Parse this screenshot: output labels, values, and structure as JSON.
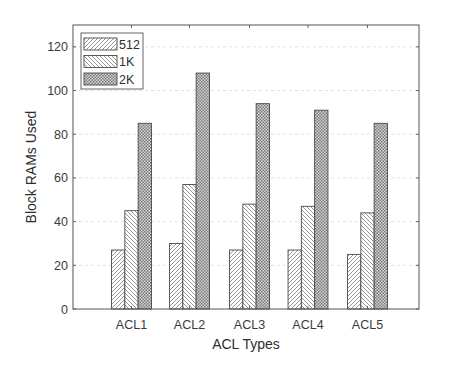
{
  "chart_data": {
    "type": "bar",
    "title": "",
    "xlabel": "ACL Types",
    "ylabel": "Block RAMs Used",
    "categories": [
      "ACL1",
      "ACL2",
      "ACL3",
      "ACL4",
      "ACL5"
    ],
    "series": [
      {
        "name": "512",
        "values": [
          27,
          30,
          27,
          27,
          25
        ],
        "pattern": "diagonal-forward-hatch"
      },
      {
        "name": "1K",
        "values": [
          45,
          57,
          48,
          47,
          44
        ],
        "pattern": "diagonal-backward-hatch"
      },
      {
        "name": "2K",
        "values": [
          85,
          108,
          94,
          91,
          85
        ],
        "pattern": "crosshatch-dots"
      }
    ],
    "ylim": [
      0,
      130
    ],
    "yticks": [
      0,
      20,
      40,
      60,
      80,
      100,
      120
    ],
    "grid": true,
    "legend_position": "upper-left"
  },
  "colors": {
    "axis": "#555555",
    "grid": "#d8d8d8",
    "bar_outline": "#4a4a4a",
    "hatch_512": "#8a8a8a",
    "hatch_1k": "#8a8a8a",
    "hatch_2k": "#6e6e6e"
  }
}
